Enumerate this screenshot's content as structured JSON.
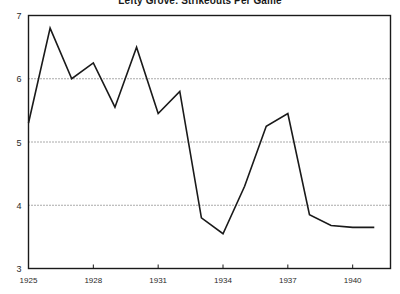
{
  "chart_data": {
    "type": "line",
    "title": "Lefty Grove: Strikeouts Per Game",
    "xlabel": "",
    "ylabel": "",
    "x": [
      1925,
      1926,
      1927,
      1928,
      1929,
      1930,
      1931,
      1932,
      1933,
      1934,
      1935,
      1936,
      1937,
      1938,
      1939,
      1940,
      1941
    ],
    "values": [
      5.3,
      6.8,
      6.0,
      6.25,
      5.55,
      6.5,
      5.45,
      5.8,
      3.8,
      3.55,
      4.3,
      5.25,
      5.45,
      3.85,
      3.68,
      3.65,
      3.65
    ],
    "series": [
      {
        "name": "Strikeouts Per Game",
        "values": [
          5.3,
          6.8,
          6.0,
          6.25,
          5.55,
          6.5,
          5.45,
          5.8,
          3.8,
          3.55,
          4.3,
          5.25,
          5.45,
          3.85,
          3.68,
          3.65,
          3.65
        ]
      }
    ],
    "xlim": [
      1925,
      1941.75
    ],
    "ylim": [
      3,
      7
    ],
    "yticks": [
      3,
      4,
      5,
      6,
      7
    ],
    "ytick_labels": [
      "3",
      "4",
      "5",
      "6",
      "7"
    ],
    "xticks": [
      1925,
      1928,
      1931,
      1934,
      1937,
      1940
    ],
    "xtick_labels": [
      "1925",
      "1928",
      "1931",
      "1934",
      "1937",
      "1940"
    ],
    "gridlines": [
      4,
      5,
      6
    ],
    "grid": true,
    "grid_style": "dotted",
    "legend": "none",
    "line_color": "#1a1a1a",
    "grid_color": "#555555",
    "frame_color": "#1a1a1a",
    "background": "#ffffff"
  }
}
